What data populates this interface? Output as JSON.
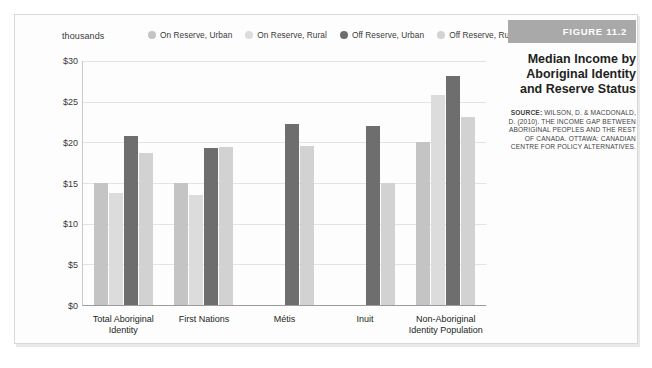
{
  "figure": {
    "band_label": "FIGURE 11.2",
    "title": "Median Income by Aboriginal Identity and Reserve Status",
    "source_prefix": "SOURCE:",
    "source_text": " WILSON, D. & MACDONALD, D. (2010). THE INCOME GAP BETWEEN ABORIGINAL PEOPLES AND THE REST OF CANADA. OTTAWA: CANADIAN CENTRE FOR POLICY ALTERNATIVES.",
    "band_color": "#a9a9a9"
  },
  "chart_data": {
    "type": "bar",
    "title": "Median Income by Aboriginal Identity and Reserve Status",
    "units_label": "thousands",
    "xlabel": "",
    "ylabel": "",
    "ylim": [
      0,
      30
    ],
    "ytick_labels": [
      "$30",
      "$25",
      "$20",
      "$15",
      "$10",
      "$5",
      "$0"
    ],
    "ytick_values": [
      30,
      25,
      20,
      15,
      10,
      5,
      0
    ],
    "grid": true,
    "legend_position": "top",
    "categories": [
      "Total Aboriginal Identity",
      "First Nations",
      "Métis",
      "Inuit",
      "Non-Aboriginal Identity Population"
    ],
    "category_lines": [
      [
        "Total Aboriginal",
        "Identity"
      ],
      [
        "First Nations"
      ],
      [
        "Métis"
      ],
      [
        "Inuit"
      ],
      [
        "Non-Aboriginal",
        "Identity Population"
      ]
    ],
    "series": [
      {
        "name": "On Reserve, Urban",
        "color": "#c4c4c4",
        "values": [
          15.0,
          15.0,
          null,
          null,
          20.1
        ]
      },
      {
        "name": "On Reserve, Rural",
        "color": "#dcdcdc",
        "values": [
          13.8,
          13.5,
          null,
          null,
          25.8
        ]
      },
      {
        "name": "Off Reserve, Urban",
        "color": "#6e6e6e",
        "values": [
          20.8,
          19.3,
          22.3,
          22.0,
          28.2
        ]
      },
      {
        "name": "Off Reserve, Rural",
        "color": "#d2d2d2",
        "values": [
          18.7,
          19.4,
          19.5,
          15.0,
          23.1
        ]
      }
    ]
  }
}
